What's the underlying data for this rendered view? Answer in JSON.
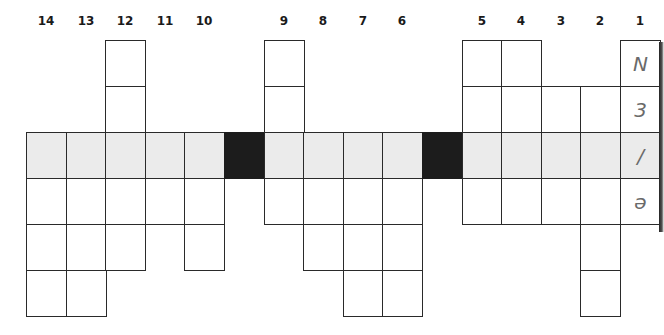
{
  "puzzle": {
    "grid_origin_x": 26,
    "grid_origin_y": 40,
    "cell_w": 39.6,
    "cell_h": 46,
    "colors": {
      "highlight_row": "#ebebeb",
      "black_cell": "#1c1c1c",
      "border": "#2a2a2a",
      "letter": "#6a6a6a"
    },
    "highlight_row_index": 2,
    "columns": [
      {
        "label": "14",
        "rows": [
          2,
          3,
          4,
          5
        ]
      },
      {
        "label": "13",
        "rows": [
          2,
          3,
          4,
          5
        ]
      },
      {
        "label": "12",
        "rows": [
          0,
          1,
          2,
          3,
          4
        ]
      },
      {
        "label": "11",
        "rows": [
          2,
          3
        ]
      },
      {
        "label": "10",
        "rows": [
          2,
          3,
          4
        ]
      },
      {
        "label": "",
        "black": true,
        "rows": [
          2
        ]
      },
      {
        "label": "9",
        "rows": [
          0,
          1,
          2,
          3
        ]
      },
      {
        "label": "8",
        "rows": [
          2,
          3,
          4
        ]
      },
      {
        "label": "7",
        "rows": [
          2,
          3,
          4,
          5
        ]
      },
      {
        "label": "6",
        "rows": [
          2,
          3,
          4,
          5
        ]
      },
      {
        "label": "",
        "black": true,
        "rows": [
          2
        ]
      },
      {
        "label": "5",
        "rows": [
          0,
          1,
          2,
          3
        ]
      },
      {
        "label": "4",
        "rows": [
          0,
          1,
          2,
          3
        ]
      },
      {
        "label": "3",
        "rows": [
          1,
          2,
          3
        ]
      },
      {
        "label": "2",
        "rows": [
          1,
          2,
          3,
          4,
          5
        ]
      },
      {
        "label": "1",
        "rows": [
          0,
          1,
          2,
          3
        ],
        "letters": {
          "0": "N",
          "1": "3",
          "2": "/",
          "3": "ə"
        }
      }
    ]
  }
}
